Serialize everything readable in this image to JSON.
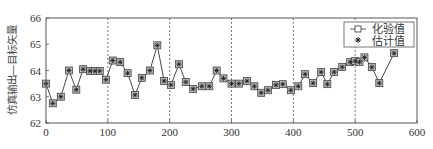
{
  "chart_data": {
    "type": "line",
    "title": "",
    "xlabel": "",
    "ylabel": "仿真输出—目标矢量",
    "xlim": [
      0,
      600
    ],
    "ylim": [
      62,
      66
    ],
    "xticks": [
      0,
      100,
      200,
      300,
      400,
      500,
      600
    ],
    "yticks": [
      62,
      63,
      64,
      65,
      66
    ],
    "grid": "vertical dashed lines at x=100,200,300,400,500",
    "legend_position": "upper right",
    "x": [
      0,
      11,
      24,
      37,
      49,
      60,
      71,
      79,
      87,
      97,
      108,
      120,
      132,
      144,
      155,
      168,
      180,
      191,
      202,
      215,
      226,
      238,
      252,
      264,
      276,
      287,
      300,
      312,
      325,
      337,
      348,
      359,
      372,
      383,
      396,
      408,
      419,
      432,
      445,
      455,
      466,
      479,
      492,
      500,
      507,
      515,
      527,
      539,
      563
    ],
    "series": [
      {
        "name": "化验值",
        "marker": "square",
        "values": [
          63.5,
          62.75,
          63.0,
          64.0,
          63.27,
          64.05,
          63.98,
          63.98,
          63.98,
          63.65,
          64.38,
          64.32,
          63.9,
          63.07,
          63.72,
          64.0,
          64.96,
          63.6,
          63.45,
          64.24,
          63.56,
          63.3,
          63.4,
          63.4,
          64.0,
          63.7,
          63.5,
          63.5,
          63.6,
          63.4,
          63.15,
          63.25,
          63.45,
          63.48,
          63.25,
          63.4,
          63.86,
          63.52,
          63.94,
          63.48,
          63.94,
          64.13,
          64.32,
          64.36,
          64.32,
          64.5,
          64.13,
          63.52,
          64.66
        ]
      },
      {
        "name": "估计值",
        "marker": "asterisk",
        "values": [
          63.5,
          62.75,
          63.0,
          64.0,
          63.27,
          64.05,
          63.98,
          63.98,
          63.98,
          63.65,
          64.38,
          64.32,
          63.9,
          63.07,
          63.72,
          64.0,
          64.96,
          63.6,
          63.45,
          64.24,
          63.56,
          63.3,
          63.4,
          63.4,
          64.0,
          63.7,
          63.5,
          63.5,
          63.6,
          63.4,
          63.15,
          63.25,
          63.45,
          63.48,
          63.25,
          63.4,
          63.86,
          63.52,
          63.94,
          63.48,
          63.94,
          64.13,
          64.32,
          64.36,
          64.32,
          64.5,
          64.13,
          63.52,
          64.66
        ]
      }
    ]
  },
  "legend": {
    "items": [
      {
        "label": "化验值",
        "icon": "square-line-marker-icon"
      },
      {
        "label": "估计值",
        "icon": "asterisk-marker-icon"
      }
    ]
  },
  "colors": {
    "axis": "#555555",
    "line": "#333333",
    "marker_fill": "#bbbbbb",
    "marker_stroke": "#444444",
    "grid": "#555555"
  }
}
